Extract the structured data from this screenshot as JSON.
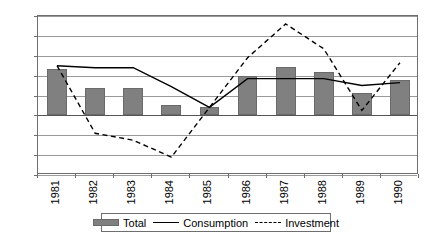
{
  "chart_data": {
    "type": "bar",
    "title": "",
    "subtitle": "",
    "xlabel": "",
    "ylabel": "",
    "ylim": [
      -6,
      10
    ],
    "ytick_values": [
      10,
      8,
      6,
      4,
      2,
      0,
      -2,
      -4,
      -6
    ],
    "ytick_labels": [
      "10",
      "8",
      "6",
      "4",
      "2",
      "0",
      "-2",
      "-4",
      "-6"
    ],
    "grid": true,
    "legend_position": "bottom",
    "categories": [
      "1981",
      "1982",
      "1983",
      "1984",
      "1985",
      "1986",
      "1987",
      "1988",
      "1989",
      "1990"
    ],
    "series": [
      {
        "name": "Total",
        "kind": "bar",
        "color": "#808080",
        "values": [
          4.7,
          2.8,
          2.8,
          1.0,
          0.8,
          4.0,
          4.9,
          4.4,
          2.3,
          3.6
        ]
      },
      {
        "name": "Consumption",
        "kind": "line",
        "style": "solid",
        "color": "#000000",
        "values": [
          5.0,
          4.8,
          4.8,
          2.9,
          0.8,
          3.7,
          3.7,
          3.7,
          3.0,
          3.3
        ]
      },
      {
        "name": "Investment",
        "kind": "line",
        "style": "dashed",
        "color": "#000000",
        "values": [
          5.0,
          -1.8,
          -2.5,
          -4.2,
          0.8,
          5.8,
          9.2,
          6.7,
          0.5,
          5.3
        ]
      }
    ]
  },
  "legend": {
    "items": [
      {
        "label": "Total",
        "marker": "bar-swatch-icon"
      },
      {
        "label": "Consumption",
        "marker": "solid-line-icon"
      },
      {
        "label": "Investment",
        "marker": "dashed-line-icon"
      }
    ]
  }
}
